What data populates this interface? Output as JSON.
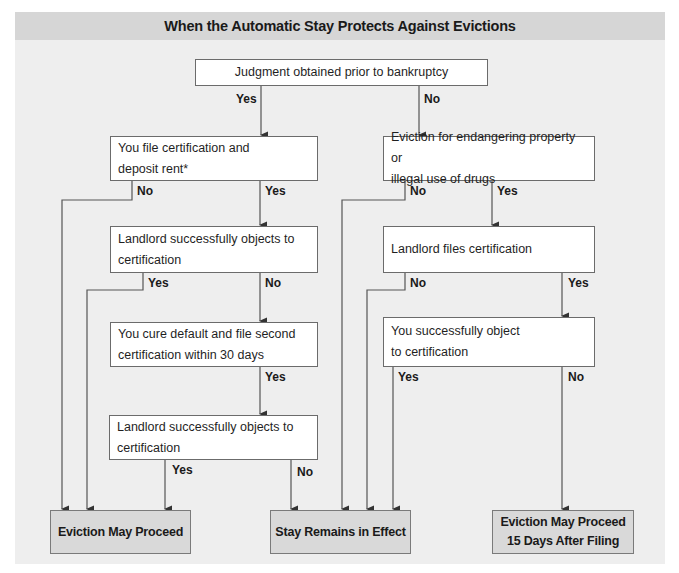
{
  "title": "When the Automatic Stay Protects Against Evictions",
  "colors": {
    "panel_background": "#eeeeee",
    "header_background": "#d6d6d6",
    "node_background": "#ffffff",
    "terminal_background": "#d9d9d9",
    "line_color": "#555555"
  },
  "nodes": {
    "judgment": "Judgment obtained prior to bankruptcy",
    "file_cert_line1": "You file certification and",
    "file_cert_line2": "deposit rent*",
    "endangering_line1": "Eviction for endangering property or",
    "endangering_line2": "illegal use of drugs",
    "landlord_objects_1_line1": "Landlord successfully objects to",
    "landlord_objects_1_line2": "certification",
    "landlord_files": "Landlord files certification",
    "cure_default_line1": "You cure default and file second",
    "cure_default_line2": "certification within 30 days",
    "you_object_line1": "You successfully object",
    "you_object_line2": "to certification",
    "landlord_objects_2_line1": "Landlord successfully objects to",
    "landlord_objects_2_line2": "certification"
  },
  "terminals": {
    "eviction_may_proceed": "Eviction May Proceed",
    "stay_remains": "Stay Remains in Effect",
    "eviction_15_line1": "Eviction May Proceed",
    "eviction_15_line2": "15 Days After Filing"
  },
  "edge_labels": {
    "judgment_yes": "Yes",
    "judgment_no": "No",
    "file_cert_no": "No",
    "file_cert_yes": "Yes",
    "endangering_no": "No",
    "endangering_yes": "Yes",
    "landlord_objects_1_yes": "Yes",
    "landlord_objects_1_no": "No",
    "landlord_files_no": "No",
    "landlord_files_yes": "Yes",
    "cure_default_yes": "Yes",
    "you_object_yes": "Yes",
    "you_object_no": "No",
    "landlord_objects_2_yes": "Yes",
    "landlord_objects_2_no": "No"
  }
}
